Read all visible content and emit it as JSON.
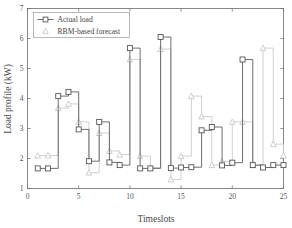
{
  "chart_data": {
    "type": "line",
    "title": "",
    "subtitle": "",
    "xlabel": "Timeslots",
    "ylabel": "Load profile (kW)",
    "xlim": [
      0,
      25
    ],
    "ylim": [
      1,
      7
    ],
    "xticks": [
      0,
      5,
      10,
      15,
      20,
      25
    ],
    "yticks": [
      1,
      2,
      3,
      4,
      5,
      6,
      7
    ],
    "xtick_labels": [
      "0",
      "5",
      "10",
      "15",
      "20",
      "25"
    ],
    "ytick_labels": [
      "1",
      "2",
      "3",
      "4",
      "5",
      "6",
      "7"
    ],
    "grid": false,
    "drawstyle": "steps-post",
    "legend_position": "top-left",
    "x": [
      1,
      2,
      3,
      4,
      5,
      6,
      7,
      8,
      9,
      10,
      11,
      12,
      13,
      14,
      15,
      16,
      17,
      18,
      19,
      20,
      21,
      22,
      23,
      24,
      25
    ],
    "series": [
      {
        "name": "Actual load",
        "marker": "square",
        "color": "#555555",
        "values": [
          1.67,
          1.67,
          4.08,
          4.22,
          2.97,
          1.91,
          3.22,
          1.87,
          1.78,
          5.68,
          1.67,
          1.67,
          6.05,
          1.68,
          1.7,
          1.71,
          2.94,
          3.05,
          1.77,
          1.86,
          5.3,
          1.78,
          1.7,
          1.78,
          1.78
        ]
      },
      {
        "name": "RBM-based forecast",
        "marker": "triangle",
        "color": "#c8c8c8",
        "values": [
          2.1,
          2.1,
          3.68,
          3.82,
          3.22,
          1.53,
          2.85,
          2.25,
          2.13,
          5.3,
          2.08,
          1.7,
          5.65,
          1.3,
          2.08,
          4.08,
          3.4,
          1.78,
          1.9,
          3.22,
          3.22,
          1.78,
          5.68,
          2.48,
          2.1
        ]
      }
    ],
    "legend": [
      {
        "label": "Actual load",
        "marker": "square",
        "color": "#555555"
      },
      {
        "label": "RBM-based forecast",
        "marker": "triangle",
        "color": "#c8c8c8"
      }
    ],
    "colors": {
      "actual": "#555555",
      "forecast": "#c8c8c8",
      "axis": "#6b6b6b",
      "background": "#ffffff"
    }
  }
}
